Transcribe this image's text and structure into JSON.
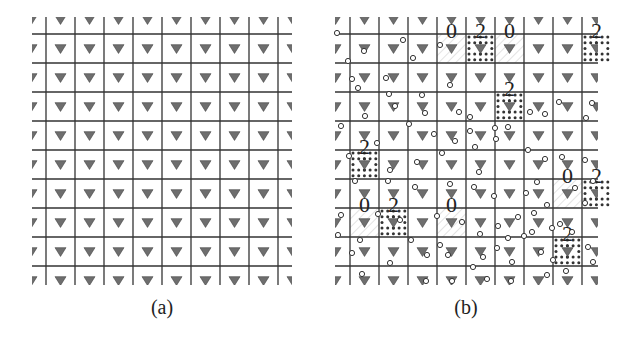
{
  "figure": {
    "panels": [
      {
        "id": "a",
        "caption": "(a)",
        "caption_x": 162,
        "caption_y": 296,
        "grid": {
          "x0": 32,
          "x1": 292,
          "y0": 17,
          "y1": 285,
          "vlines": [
            46,
            75,
            104,
            133,
            162,
            191,
            220,
            249,
            278
          ],
          "hlines": [
            34,
            63,
            92,
            121,
            150,
            179,
            208,
            237,
            266
          ]
        },
        "markers": "triangle-down",
        "highlight_cells": [],
        "circles": []
      },
      {
        "id": "b",
        "caption": "(b)",
        "caption_x": 466,
        "caption_y": 296,
        "grid": {
          "x0": 335,
          "x1": 598,
          "y0": 17,
          "y1": 285,
          "vlines": [
            350,
            379,
            408,
            437,
            466,
            495,
            524,
            553,
            582
          ],
          "hlines": [
            34,
            63,
            92,
            121,
            150,
            179,
            208,
            237,
            266
          ]
        },
        "markers": "triangle-down",
        "highlight_cells": [
          {
            "type": "hatched",
            "col": 3,
            "row": 0,
            "label": "0"
          },
          {
            "type": "dotted",
            "col": 4,
            "row": 0,
            "label": "2"
          },
          {
            "type": "hatched",
            "col": 5,
            "row": 0,
            "label": "0"
          },
          {
            "type": "dotted",
            "col": 8,
            "row": 0,
            "label": "2"
          },
          {
            "type": "dotted",
            "col": 5,
            "row": 2,
            "label": "2"
          },
          {
            "type": "dotted",
            "col": 0,
            "row": 4,
            "label": "2"
          },
          {
            "type": "hatched",
            "col": 7,
            "row": 5,
            "label": "0"
          },
          {
            "type": "dotted",
            "col": 8,
            "row": 5,
            "label": "2"
          },
          {
            "type": "hatched",
            "col": 0,
            "row": 6,
            "label": "0"
          },
          {
            "type": "dotted",
            "col": 1,
            "row": 6,
            "label": "2"
          },
          {
            "type": "hatched",
            "col": 3,
            "row": 6,
            "label": "0"
          },
          {
            "type": "dotted",
            "col": 7,
            "row": 7,
            "label": "2"
          }
        ],
        "circles": [
          [
            337,
            33
          ],
          [
            364,
            51
          ],
          [
            348,
            61
          ],
          [
            403,
            40
          ],
          [
            413,
            58
          ],
          [
            440,
            45
          ],
          [
            352,
            79
          ],
          [
            386,
            78
          ],
          [
            358,
            88
          ],
          [
            389,
            94
          ],
          [
            422,
            95
          ],
          [
            450,
            85
          ],
          [
            365,
            116
          ],
          [
            395,
            106
          ],
          [
            425,
            113
          ],
          [
            459,
            112
          ],
          [
            341,
            126
          ],
          [
            409,
            124
          ],
          [
            434,
            134
          ],
          [
            470,
            117
          ],
          [
            470,
            131
          ],
          [
            495,
            128
          ],
          [
            496,
            139
          ],
          [
            508,
            127
          ],
          [
            530,
            112
          ],
          [
            545,
            114
          ],
          [
            559,
            102
          ],
          [
            586,
            118
          ],
          [
            592,
            103
          ],
          [
            349,
            156
          ],
          [
            377,
            143
          ],
          [
            390,
            170
          ],
          [
            417,
            162
          ],
          [
            442,
            153
          ],
          [
            455,
            141
          ],
          [
            475,
            147
          ],
          [
            479,
            172
          ],
          [
            528,
            150
          ],
          [
            545,
            159
          ],
          [
            562,
            157
          ],
          [
            585,
            160
          ],
          [
            593,
            181
          ],
          [
            355,
            181
          ],
          [
            388,
            181
          ],
          [
            415,
            187
          ],
          [
            450,
            184
          ],
          [
            474,
            187
          ],
          [
            494,
            196
          ],
          [
            526,
            193
          ],
          [
            537,
            182
          ],
          [
            547,
            205
          ],
          [
            575,
            188
          ],
          [
            585,
            203
          ],
          [
            341,
            215
          ],
          [
            378,
            214
          ],
          [
            400,
            220
          ],
          [
            437,
            216
          ],
          [
            462,
            222
          ],
          [
            498,
            226
          ],
          [
            518,
            217
          ],
          [
            534,
            213
          ],
          [
            524,
            236
          ],
          [
            338,
            235
          ],
          [
            360,
            240
          ],
          [
            411,
            240
          ],
          [
            440,
            245
          ],
          [
            448,
            255
          ],
          [
            480,
            234
          ],
          [
            497,
            248
          ],
          [
            508,
            238
          ],
          [
            532,
            232
          ],
          [
            552,
            228
          ],
          [
            560,
            224
          ],
          [
            588,
            247
          ],
          [
            572,
            232
          ],
          [
            352,
            253
          ],
          [
            390,
            263
          ],
          [
            427,
            255
          ],
          [
            473,
            267
          ],
          [
            483,
            257
          ],
          [
            512,
            262
          ],
          [
            541,
            252
          ],
          [
            553,
            260
          ],
          [
            566,
            271
          ],
          [
            593,
            262
          ],
          [
            362,
            274
          ],
          [
            426,
            281
          ],
          [
            452,
            281
          ],
          [
            511,
            281
          ],
          [
            487,
            279
          ],
          [
            547,
            275
          ]
        ]
      }
    ]
  }
}
